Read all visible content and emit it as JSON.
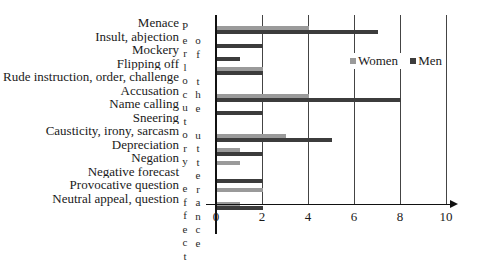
{
  "chart_data": {
    "type": "bar",
    "orientation": "horizontal",
    "title": "",
    "xlabel": "",
    "ylabel": "Perlocutory effect of the utterance",
    "ylabel_columns": [
      "Perlocutory effect",
      "of the utterance"
    ],
    "categories": [
      "Menace",
      "Insult, abjection",
      "Mockery",
      "Flipping off",
      "Rude instruction, order, challenge",
      "Accusation",
      "Name calling",
      "Sneering",
      "Causticity, irony, sarcasm",
      "Depreciation",
      "Negation",
      "Negative forecast",
      "Provocative question",
      "Neutral appeal, question"
    ],
    "series": [
      {
        "name": "Women",
        "color": "#9a9a9a",
        "values": [
          4,
          0,
          0,
          2,
          0,
          4,
          0,
          0,
          3,
          1,
          1,
          0,
          2,
          1
        ]
      },
      {
        "name": "Men",
        "color": "#3c3c3c",
        "values": [
          7,
          2,
          1,
          2,
          0,
          8,
          2,
          0,
          5,
          2,
          0,
          2,
          0,
          2
        ]
      }
    ],
    "xlim": [
      0,
      10
    ],
    "xticks": [
      "0",
      "2",
      "4",
      "6",
      "8",
      "10"
    ],
    "grid": true,
    "legend_position": "upper right inside"
  },
  "legend": {
    "women": "Women",
    "men": "Men"
  },
  "vertical_text": {
    "col1": [
      "P",
      "e",
      "r",
      "l",
      "o",
      "c",
      "u",
      "t",
      "o",
      "r",
      "y",
      "",
      "e",
      "f",
      "f",
      "e",
      "c",
      "t"
    ],
    "col2": [
      "o",
      "f",
      "",
      "t",
      "h",
      "e",
      "",
      "u",
      "t",
      "t",
      "e",
      "r",
      "a",
      "n",
      "c",
      "e"
    ]
  }
}
